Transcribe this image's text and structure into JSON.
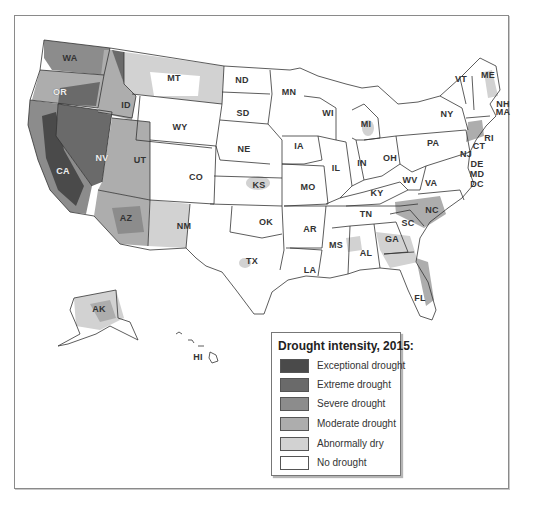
{
  "map": {
    "title": "Drought intensity, 2015",
    "states": [
      {
        "abbr": "WA",
        "x": 70,
        "y": 58,
        "light": false
      },
      {
        "abbr": "OR",
        "x": 60,
        "y": 92,
        "light": true
      },
      {
        "abbr": "CA",
        "x": 63,
        "y": 171,
        "light": true
      },
      {
        "abbr": "NV",
        "x": 102,
        "y": 158,
        "light": true
      },
      {
        "abbr": "ID",
        "x": 126,
        "y": 105,
        "light": false
      },
      {
        "abbr": "MT",
        "x": 174,
        "y": 78,
        "light": false
      },
      {
        "abbr": "WY",
        "x": 180,
        "y": 127,
        "light": false
      },
      {
        "abbr": "UT",
        "x": 140,
        "y": 160,
        "light": false
      },
      {
        "abbr": "AZ",
        "x": 126,
        "y": 218,
        "light": false
      },
      {
        "abbr": "CO",
        "x": 196,
        "y": 177,
        "light": false
      },
      {
        "abbr": "NM",
        "x": 184,
        "y": 226,
        "light": false
      },
      {
        "abbr": "ND",
        "x": 242,
        "y": 80,
        "light": false
      },
      {
        "abbr": "SD",
        "x": 243,
        "y": 113,
        "light": false
      },
      {
        "abbr": "NE",
        "x": 244,
        "y": 149,
        "light": false
      },
      {
        "abbr": "KS",
        "x": 259,
        "y": 185,
        "light": false
      },
      {
        "abbr": "OK",
        "x": 266,
        "y": 222,
        "light": false
      },
      {
        "abbr": "TX",
        "x": 252,
        "y": 261,
        "light": false
      },
      {
        "abbr": "MN",
        "x": 289,
        "y": 92,
        "light": false
      },
      {
        "abbr": "IA",
        "x": 299,
        "y": 146,
        "light": false
      },
      {
        "abbr": "MO",
        "x": 308,
        "y": 187,
        "light": false
      },
      {
        "abbr": "AR",
        "x": 310,
        "y": 229,
        "light": false
      },
      {
        "abbr": "LA",
        "x": 310,
        "y": 270,
        "light": false
      },
      {
        "abbr": "WI",
        "x": 328,
        "y": 113,
        "light": false
      },
      {
        "abbr": "IL",
        "x": 336,
        "y": 168,
        "light": false
      },
      {
        "abbr": "MI",
        "x": 366,
        "y": 124,
        "light": false
      },
      {
        "abbr": "IN",
        "x": 362,
        "y": 163,
        "light": false
      },
      {
        "abbr": "OH",
        "x": 390,
        "y": 158,
        "light": false
      },
      {
        "abbr": "KY",
        "x": 377,
        "y": 193,
        "light": false
      },
      {
        "abbr": "TN",
        "x": 366,
        "y": 214,
        "light": false
      },
      {
        "abbr": "MS",
        "x": 336,
        "y": 245,
        "light": false
      },
      {
        "abbr": "AL",
        "x": 366,
        "y": 253,
        "light": false
      },
      {
        "abbr": "GA",
        "x": 392,
        "y": 239,
        "light": false
      },
      {
        "abbr": "FL",
        "x": 420,
        "y": 298,
        "light": false
      },
      {
        "abbr": "SC",
        "x": 408,
        "y": 223,
        "light": false
      },
      {
        "abbr": "NC",
        "x": 432,
        "y": 210,
        "light": false
      },
      {
        "abbr": "VA",
        "x": 431,
        "y": 183,
        "light": false
      },
      {
        "abbr": "WV",
        "x": 410,
        "y": 180,
        "light": false
      },
      {
        "abbr": "PA",
        "x": 433,
        "y": 143,
        "light": false
      },
      {
        "abbr": "NY",
        "x": 447,
        "y": 114,
        "light": false
      },
      {
        "abbr": "VT",
        "x": 461,
        "y": 79,
        "light": false
      },
      {
        "abbr": "ME",
        "x": 488,
        "y": 75,
        "light": false
      },
      {
        "abbr": "NH",
        "x": 503,
        "y": 104,
        "light": false
      },
      {
        "abbr": "MA",
        "x": 503,
        "y": 112,
        "light": false
      },
      {
        "abbr": "RI",
        "x": 489,
        "y": 138,
        "light": false
      },
      {
        "abbr": "CT",
        "x": 479,
        "y": 146,
        "light": false
      },
      {
        "abbr": "NJ",
        "x": 466,
        "y": 154,
        "light": false
      },
      {
        "abbr": "DE",
        "x": 477,
        "y": 164,
        "light": false
      },
      {
        "abbr": "MD",
        "x": 477,
        "y": 174,
        "light": false
      },
      {
        "abbr": "DC",
        "x": 477,
        "y": 184,
        "light": false
      },
      {
        "abbr": "AK",
        "x": 99,
        "y": 309,
        "light": false
      },
      {
        "abbr": "HI",
        "x": 198,
        "y": 357,
        "light": false
      }
    ]
  },
  "legend": {
    "title": "Drought intensity, 2015:",
    "items": [
      {
        "label": "Exceptional drought",
        "color": "#4a4a4a"
      },
      {
        "label": "Extreme drought",
        "color": "#6a6a6a"
      },
      {
        "label": "Severe drought",
        "color": "#8c8c8c"
      },
      {
        "label": "Moderate drought",
        "color": "#adadad"
      },
      {
        "label": "Abnormally dry",
        "color": "#d2d2d2"
      },
      {
        "label": "No drought",
        "color": "#ffffff"
      }
    ]
  },
  "colors": {
    "exceptional": "#4a4a4a",
    "extreme": "#6a6a6a",
    "severe": "#8c8c8c",
    "moderate": "#adadad",
    "dry": "#d2d2d2",
    "none": "#ffffff",
    "border": "#333333"
  }
}
